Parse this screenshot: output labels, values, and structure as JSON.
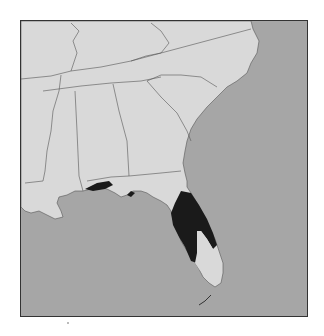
{
  "map": {
    "title": "",
    "region": "Southeastern United States",
    "colors": {
      "land": "#d9d9d9",
      "water": "#a6a6a6",
      "range": "#1a1a1a",
      "border": "#555555",
      "frame": "#333333"
    },
    "legend": [],
    "highlighted_areas": [
      "Florida panhandle coast",
      "Central Florida peninsula"
    ]
  }
}
